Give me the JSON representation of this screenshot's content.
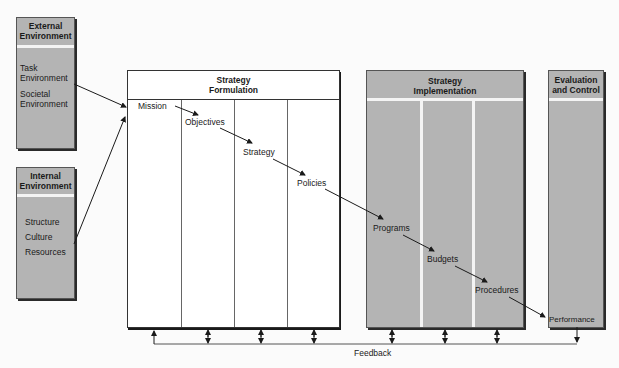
{
  "external_environment": {
    "title_line1": "External",
    "title_line2": "Environment",
    "items": [
      "Task",
      "Environment",
      "Societal",
      "Environment"
    ]
  },
  "internal_environment": {
    "title_line1": "Internal",
    "title_line2": "Environment",
    "items": [
      "Structure",
      "Culture",
      "Resources"
    ]
  },
  "strategy_formulation": {
    "title_line1": "Strategy",
    "title_line2": "Formulation",
    "steps": [
      "Mission",
      "Objectives",
      "Strategy",
      "Policies"
    ]
  },
  "strategy_implementation": {
    "title_line1": "Strategy",
    "title_line2": "Implementation",
    "steps": [
      "Programs",
      "Budgets",
      "Procedures"
    ]
  },
  "evaluation_control": {
    "title_line1": "Evaluation",
    "title_line2": "and Control",
    "steps": [
      "Performance"
    ]
  },
  "feedback": {
    "label": "Feedback"
  },
  "colors": {
    "panel_gray": "#b4b4b4",
    "panel_white": "#ffffff",
    "line": "#1a1a1a"
  }
}
